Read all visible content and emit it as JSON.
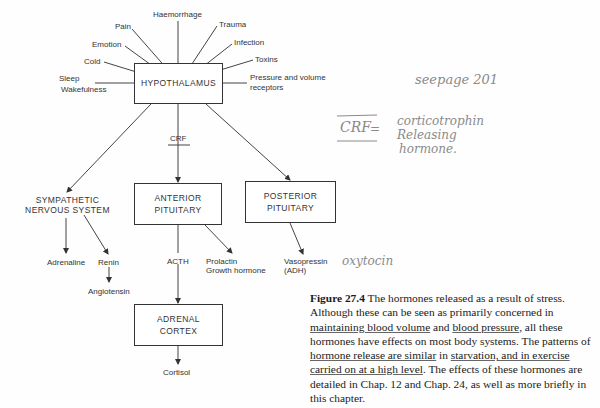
{
  "diagram": {
    "central_node": "HYPOTHALAMUS",
    "stressors": [
      {
        "label": "Haemorrhage"
      },
      {
        "label": "Pain"
      },
      {
        "label": "Trauma"
      },
      {
        "label": "Emotion"
      },
      {
        "label": "Infection"
      },
      {
        "label": "Cold"
      },
      {
        "label": "Toxins"
      },
      {
        "label": "Sleep"
      },
      {
        "label": "Wakefulness"
      },
      {
        "label": "Pressure and volume"
      },
      {
        "label": "receptors"
      }
    ],
    "crf_label": "CRF",
    "nodes": {
      "sympathetic_line1": "SYMPATHETIC",
      "sympathetic_line2": "NERVOUS SYSTEM",
      "anterior_line1": "ANTERIOR",
      "anterior_line2": "PITUITARY",
      "posterior_line1": "POSTERIOR",
      "posterior_line2": "PITUITARY",
      "adrenal_line1": "ADRENAL",
      "adrenal_line2": "CORTEX"
    },
    "outputs": {
      "adrenaline": "Adrenaline",
      "renin": "Renin",
      "angiotensin": "Angiotensin",
      "acth": "ACTH",
      "prolactin": "Prolactin",
      "growth_hormone": "Growth hormone",
      "vasopressin": "Vasopressin",
      "adh": "(ADH)",
      "cortisol": "Cortisol"
    }
  },
  "handwritten_notes": {
    "see_page": "seepage 201",
    "crf_abbrev": "CRF",
    "crf_dash": "=",
    "crf_def_line1": "corticotrophin",
    "crf_def_line2": "Releasing",
    "crf_def_line3": "hormone.",
    "oxytocin": "oxytocin"
  },
  "caption": {
    "figure_label": "Figure 27.4",
    "seg1": " The hormones released as a result of stress. Although these can be seen as primarily concerned in ",
    "ul1": "maintaining blood volume",
    "seg2": " and ",
    "ul2": "blood pressure",
    "seg3": ", all these hormones have effects on most body systems. The patterns of ",
    "ul3": "hormone release are similar",
    "seg4": " in ",
    "ul4": "starvation, and in exercise carried on at a high level",
    "seg5": ". The effects of these hormones are detailed in Chap. 12 and Chap. 24, as well as more briefly in this chapter."
  }
}
